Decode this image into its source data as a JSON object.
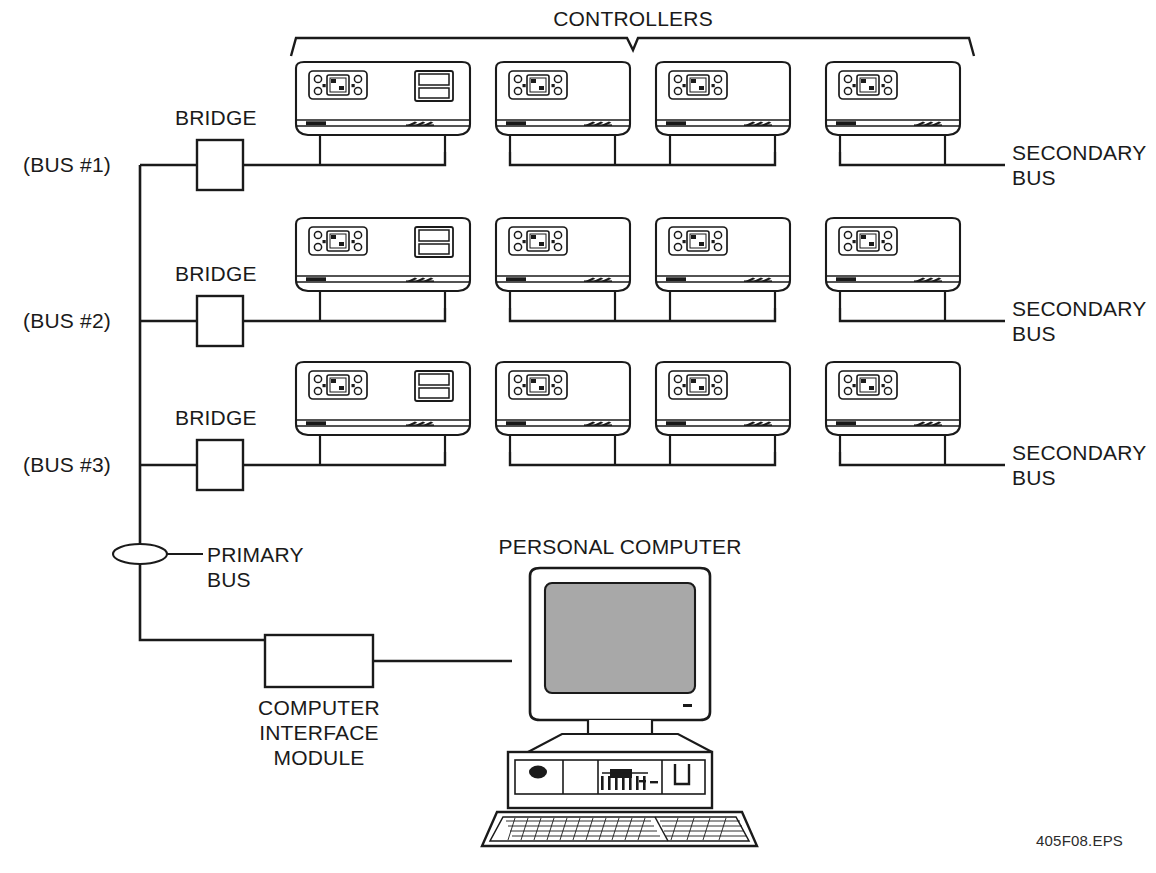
{
  "diagram": {
    "title_bracket": "CONTROLLERS",
    "eps_tag": "405F08.EPS",
    "colors": {
      "line": "#1a1a1a",
      "screen_fill": "#a8a8a8",
      "background": "#ffffff"
    },
    "bus_rows": [
      {
        "bus_label": "(BUS #1)",
        "bridge_label": "BRIDGE",
        "secondary_bus_label_line1": "SECONDARY",
        "secondary_bus_label_line2": "BUS",
        "controllers": [
          {
            "has_side_panel": true
          },
          {
            "has_side_panel": false
          },
          {
            "has_side_panel": false
          },
          {
            "has_side_panel": false
          }
        ]
      },
      {
        "bus_label": "(BUS #2)",
        "bridge_label": "BRIDGE",
        "secondary_bus_label_line1": "SECONDARY",
        "secondary_bus_label_line2": "BUS",
        "controllers": [
          {
            "has_side_panel": true
          },
          {
            "has_side_panel": false
          },
          {
            "has_side_panel": false
          },
          {
            "has_side_panel": false
          }
        ]
      },
      {
        "bus_label": "(BUS #3)",
        "bridge_label": "BRIDGE",
        "secondary_bus_label_line1": "SECONDARY",
        "secondary_bus_label_line2": "BUS",
        "controllers": [
          {
            "has_side_panel": true
          },
          {
            "has_side_panel": false
          },
          {
            "has_side_panel": false
          },
          {
            "has_side_panel": false
          }
        ]
      }
    ],
    "primary_bus": {
      "label_line1": "PRIMARY",
      "label_line2": "BUS"
    },
    "interface_module": {
      "label_line1": "COMPUTER",
      "label_line2": "INTERFACE",
      "label_line3": "MODULE"
    },
    "personal_computer": {
      "label": "PERSONAL COMPUTER"
    }
  }
}
